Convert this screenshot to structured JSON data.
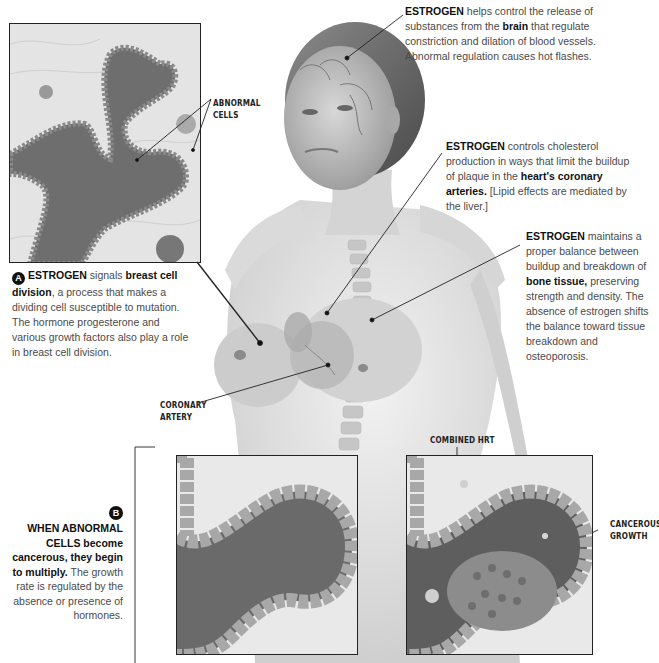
{
  "captions": {
    "brain": {
      "lead": "ESTROGEN",
      "text1": " helps control the release of substances from the ",
      "bold1": "brain",
      "text2": " that regulate constriction and dilation of blood vessels. Abnormal regulation causes hot flashes."
    },
    "heart": {
      "lead": "ESTROGEN",
      "text1": " controls cholesterol production in ways that limit the buildup of plaque in the ",
      "bold1": "heart's coronary arteries.",
      "text2": " [Lipid effects are mediated by the liver.]"
    },
    "bone": {
      "lead": "ESTROGEN",
      "text1": " maintains a proper balance between buildup and breakdown of ",
      "bold1": "bone tissue,",
      "text2": " preserving strength and density. The absence of estrogen shifts the balance toward tissue breakdown and osteoporosis."
    },
    "breast": {
      "marker": "A",
      "lead": "ESTROGEN",
      "text1": " signals ",
      "bold1": "breast cell division",
      "text2": ", a process that makes a dividing cell susceptible to mutation. The hormone progesterone and various growth factors also play a role in breast cell division."
    },
    "growth": {
      "marker": "B",
      "bold1": "WHEN ABNORMAL CELLS become cancerous, they begin to multiply.",
      "text1": " The growth rate is regulated by the absence or presence of hormones."
    }
  },
  "labels": {
    "abnormal_cells": "ABNORMAL CELLS",
    "coronary_artery": "CORONARY ARTERY",
    "combined_hrt": "COMBINED HRT",
    "cancerous_growth": "CANCEROUS GROWTH"
  },
  "colors": {
    "ink": "#111111",
    "body_text": "#4a4a4a",
    "skin": "#e2e2e2",
    "lumen": "#6a6a6a",
    "cell": "#9a9a9a"
  }
}
